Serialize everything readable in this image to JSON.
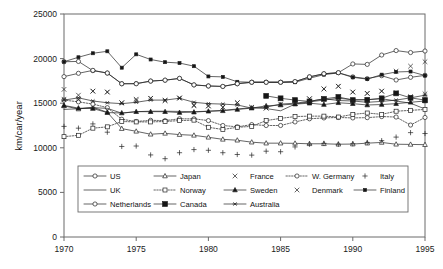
{
  "chart_data": {
    "type": "line",
    "title": "",
    "xlabel": "",
    "ylabel": "km/car/year",
    "xlim": [
      1970,
      1995
    ],
    "ylim": [
      0,
      25000
    ],
    "ytick_values": [
      0,
      5000,
      10000,
      15000,
      20000,
      25000
    ],
    "ytick_labels": [
      "0",
      "5000",
      "10000",
      "15000",
      "20000",
      "25000"
    ],
    "xtick_values": [
      1970,
      1975,
      1980,
      1985,
      1990,
      1995
    ],
    "xtick_labels": [
      "1970",
      "1975",
      "1980",
      "1985",
      "1990",
      "1995"
    ],
    "grid": false,
    "legend_position": "inside-bottom-center",
    "x": [
      1970,
      1971,
      1972,
      1973,
      1974,
      1975,
      1976,
      1977,
      1978,
      1979,
      1980,
      1981,
      1982,
      1983,
      1984,
      1985,
      1986,
      1987,
      1988,
      1989,
      1990,
      1991,
      1992,
      1993,
      1994,
      1995
    ],
    "series": [
      {
        "name": "US",
        "marker": "open-circle",
        "line": "solid",
        "values": [
          19650,
          19680,
          18650,
          18380,
          17180,
          17200,
          17480,
          17580,
          17780,
          17050,
          16930,
          16880,
          17180,
          17350,
          17350,
          17350,
          17420,
          17950,
          18300,
          18420,
          17950,
          17750,
          18080,
          17600,
          17900,
          18120
        ]
      },
      {
        "name": "Japan",
        "marker": "open-triangle",
        "line": "solid",
        "values": [
          14700,
          14350,
          14550,
          13980,
          12150,
          11850,
          11520,
          11620,
          11480,
          11400,
          11180,
          10950,
          10850,
          10630,
          10520,
          10520,
          10500,
          10450,
          10450,
          10400,
          10420,
          10520,
          10600,
          10400,
          10380,
          10350
        ]
      },
      {
        "name": "France",
        "marker": "x-cross",
        "line": "none",
        "values": [
          16550,
          15900,
          16350,
          16250,
          15050,
          15450,
          15550,
          15300,
          15580,
          14700,
          14680,
          14550,
          15050,
          14500,
          14450,
          14900,
          15000,
          15500,
          16600,
          16900,
          16250,
          16100,
          16350,
          16200,
          15750,
          16050
        ]
      },
      {
        "name": "W. Germany",
        "marker": "open-circle",
        "line": "dotted",
        "values": [
          15350,
          15150,
          14900,
          14500,
          13200,
          12950,
          13080,
          13050,
          13250,
          13250,
          13050,
          12500,
          12350,
          12600,
          12500,
          12500,
          12900,
          13250,
          13350,
          13400,
          13350,
          13380,
          13500,
          13450,
          12550,
          13400
        ]
      },
      {
        "name": "Italy",
        "marker": "plus",
        "line": "none",
        "values": [
          12400,
          12200,
          12680,
          11750,
          10150,
          10200,
          9200,
          8780,
          9450,
          9800,
          9720,
          9450,
          9250,
          9180,
          9620,
          9560,
          10100,
          10400,
          10500,
          10400,
          10450,
          10600,
          10800,
          11200,
          11700,
          11600
        ]
      },
      {
        "name": "UK",
        "marker": "none",
        "line": "solid",
        "values": [
          14300,
          14380,
          14500,
          14420,
          13880,
          14050,
          14100,
          14100,
          14080,
          14050,
          14100,
          14200,
          14350,
          14500,
          14400,
          14150,
          14900,
          15150,
          15350,
          15550,
          15400,
          15400,
          15500,
          15250,
          15000,
          14350
        ]
      },
      {
        "name": "Norway",
        "marker": "open-square",
        "line": "dotted",
        "values": [
          11250,
          11400,
          12200,
          12350,
          12950,
          12900,
          12900,
          12950,
          13050,
          13100,
          12300,
          12050,
          12300,
          12400,
          13050,
          13300,
          13500,
          13550,
          13550,
          13450,
          13750,
          13900,
          13750,
          14100,
          14200,
          14300
        ]
      },
      {
        "name": "Sweden",
        "marker": "solid-triangle",
        "line": "solid",
        "values": [
          14750,
          14450,
          14400,
          13950,
          13900,
          14050,
          14050,
          14050,
          13950,
          14000,
          14100,
          14150,
          14300,
          14450,
          14700,
          14800,
          14900,
          15000,
          14850,
          15050,
          14950,
          14800,
          14850,
          14950,
          15100,
          15250
        ]
      },
      {
        "name": "Denmark",
        "marker": "x-cross",
        "line": "none",
        "values": [
          15450,
          15400,
          16350,
          16250,
          15050,
          15300,
          15550,
          15300,
          15580,
          14800,
          14700,
          14550,
          15050,
          14550,
          14450,
          15550,
          15000,
          15500,
          16600,
          16900,
          16250,
          16100,
          16350,
          18600,
          19150,
          19650
        ]
      },
      {
        "name": "Finland",
        "marker": "solid-small",
        "line": "solid",
        "values": [
          19650,
          20150,
          20600,
          20820,
          18980,
          20480,
          19900,
          19600,
          19500,
          19150,
          18000,
          17950,
          17400,
          17350,
          17350,
          17350,
          17350,
          17800,
          18200,
          18400,
          17900,
          17700,
          18200,
          18500,
          18550,
          18100
        ]
      },
      {
        "name": "Netherlands",
        "marker": "open-circle",
        "line": "solid",
        "values": [
          17980,
          18350,
          18680,
          18380,
          17180,
          17180,
          17480,
          17580,
          17780,
          17050,
          16930,
          16880,
          17180,
          17350,
          17350,
          17350,
          17420,
          17950,
          18300,
          18420,
          19400,
          19350,
          20400,
          20900,
          20680,
          20850
        ]
      },
      {
        "name": "Canada",
        "marker": "solid-square",
        "line": "solid",
        "values": [
          null,
          null,
          null,
          null,
          null,
          null,
          null,
          null,
          null,
          null,
          null,
          null,
          null,
          null,
          15820,
          15550,
          15350,
          15200,
          15480,
          15700,
          15350,
          15380,
          15550,
          16100,
          15600,
          15350
        ]
      },
      {
        "name": "Australia",
        "marker": "solid-star",
        "line": "solid",
        "values": [
          15350,
          15600,
          15250,
          15050,
          14950,
          15100,
          15350,
          15350,
          15550,
          15100,
          14950,
          14900,
          14800,
          14450,
          14550,
          14900,
          15000,
          15200,
          15500,
          15300,
          15250,
          15100,
          15200,
          15350,
          15600,
          15900
        ]
      }
    ],
    "legend_rows": [
      [
        "US",
        "Japan",
        "France",
        "W. Germany",
        "Italy"
      ],
      [
        "UK",
        "Norway",
        "Sweden",
        "Denmark",
        "Finland"
      ],
      [
        "Netherlands",
        "Canada",
        "Australia"
      ]
    ]
  },
  "colors": {
    "ink": "#1a1a1a",
    "frame": "#6b6b6b",
    "background": "#ffffff"
  }
}
